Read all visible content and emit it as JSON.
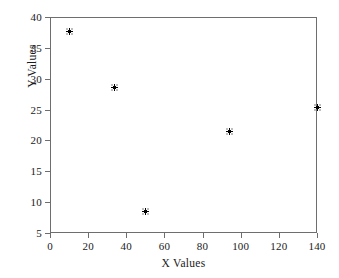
{
  "chart_data": {
    "type": "scatter",
    "title": "",
    "xlabel": "X Values",
    "ylabel": "Y Values",
    "xlim": [
      0,
      140
    ],
    "ylim": [
      5,
      40
    ],
    "xticks": [
      0,
      20,
      40,
      60,
      80,
      100,
      120,
      140
    ],
    "yticks": [
      5,
      10,
      15,
      20,
      25,
      30,
      35,
      40
    ],
    "xticklabels": [
      "0",
      "20",
      "40",
      "60",
      "80",
      "100",
      "120",
      "140"
    ],
    "yticklabels": [
      "5",
      "10",
      "15",
      "20",
      "25",
      "30",
      "35",
      "40"
    ],
    "grid": false,
    "legend": null,
    "marker": "asterisk-square",
    "marker_color": "#000000",
    "frame_color": "#6e6e6e",
    "series": [
      {
        "name": "data",
        "points": [
          {
            "x": 10,
            "y": 37.6
          },
          {
            "x": 34,
            "y": 28.5
          },
          {
            "x": 50,
            "y": 8.5
          },
          {
            "x": 94,
            "y": 21.4
          },
          {
            "x": 140,
            "y": 25.3
          }
        ]
      }
    ]
  }
}
